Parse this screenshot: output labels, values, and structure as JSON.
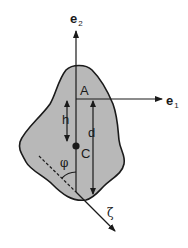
{
  "diagram": {
    "type": "rigid body pendulum schematic",
    "colors": {
      "body_fill": "#b8b8b8",
      "stroke": "#1a1a1a",
      "background": "#ffffff"
    },
    "labels": {
      "e2": {
        "base": "e",
        "subscript": "2"
      },
      "e1": {
        "base": "e",
        "subscript": "1"
      },
      "pivot": "A",
      "h": "h",
      "d": "d",
      "centroid": "C",
      "angle": "φ",
      "axis": "ζ"
    }
  }
}
